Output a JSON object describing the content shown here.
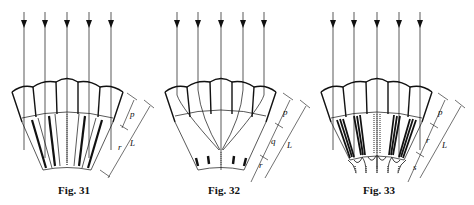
{
  "figures": [
    {
      "id": "fig31",
      "caption": "Fig. 31",
      "rays": 5,
      "dimension_labels": [
        "p",
        "r",
        "L"
      ],
      "structure": "apposition eye: facet lenses with cones, rhabdoms directly beneath each facet"
    },
    {
      "id": "fig32",
      "caption": "Fig. 32",
      "rays": 5,
      "dimension_labels": [
        "p",
        "q",
        "r",
        "L"
      ],
      "structure": "superposition eye: rays converge through clear zone onto central rhabdom"
    },
    {
      "id": "fig33",
      "caption": "Fig. 33",
      "rays": 5,
      "dimension_labels": [
        "p",
        "r",
        "s",
        "L"
      ],
      "structure": "eye with multiple rhabdomeres per ommatidium and basal structures"
    }
  ],
  "colors": {
    "line": "#111111",
    "background": "#ffffff"
  }
}
